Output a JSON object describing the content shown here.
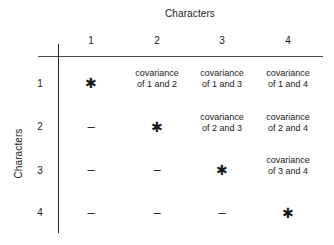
{
  "figure": {
    "column_axis_title": "Characters",
    "row_axis_title": "Characters",
    "column_headers": [
      "1",
      "2",
      "3",
      "4"
    ],
    "row_headers": [
      "1",
      "2",
      "3",
      "4"
    ],
    "glyphs": {
      "diagonal": "✱",
      "lower": "–"
    },
    "cells": [
      [
        {
          "type": "diagonal",
          "text": "✱"
        },
        {
          "type": "covariance",
          "line1": "covariance",
          "line2": "of 1 and 2"
        },
        {
          "type": "covariance",
          "line1": "covariance",
          "line2": "of 1 and 3"
        },
        {
          "type": "covariance",
          "line1": "covariance",
          "line2": "of 1 and 4"
        }
      ],
      [
        {
          "type": "lower",
          "text": "–"
        },
        {
          "type": "diagonal",
          "text": "✱"
        },
        {
          "type": "covariance",
          "line1": "covariance",
          "line2": "of 2 and 3"
        },
        {
          "type": "covariance",
          "line1": "covariance",
          "line2": "of 2 and 4"
        }
      ],
      [
        {
          "type": "lower",
          "text": "–"
        },
        {
          "type": "lower",
          "text": "–"
        },
        {
          "type": "diagonal",
          "text": "✱"
        },
        {
          "type": "covariance",
          "line1": "covariance",
          "line2": "of 3 and 4"
        }
      ],
      [
        {
          "type": "lower",
          "text": "–"
        },
        {
          "type": "lower",
          "text": "–"
        },
        {
          "type": "lower",
          "text": "–"
        },
        {
          "type": "diagonal",
          "text": "✱"
        }
      ]
    ]
  },
  "colors": {
    "background": "#ffffff",
    "text": "#1a1a1a",
    "horizontal_rule": "#4a4a4a",
    "vertical_rule": "#262626"
  }
}
